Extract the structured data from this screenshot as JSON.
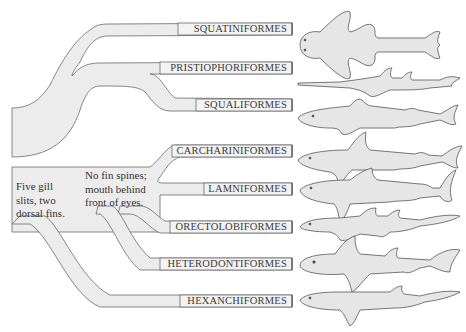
{
  "colors": {
    "band_fill": "#ececec",
    "band_stroke": "#6a6a6a",
    "text": "#333333",
    "shark_fill": "#e6e6e6",
    "shark_stroke": "#555555"
  },
  "root_trait": {
    "lines": [
      "Five gill",
      "slits, two",
      "dorsal fins."
    ]
  },
  "galeomorph_trait": {
    "lines": [
      "No fin spines;",
      "mouth behind",
      "front of eyes."
    ]
  },
  "orders": [
    {
      "name": "SQUATINIFORMES",
      "y": 23,
      "shark": "angel-shark"
    },
    {
      "name": "PRISTIOPHORIFORMES",
      "y": 62,
      "shark": "sawshark"
    },
    {
      "name": "SQUALIFORMES",
      "y": 99,
      "shark": "dogfish-shark"
    },
    {
      "name": "CARCHARINIFORMES",
      "y": 145,
      "shark": "ground-shark"
    },
    {
      "name": "LAMNIFORMES",
      "y": 183,
      "shark": "mackerel-shark"
    },
    {
      "name": "ORECTOLOBIFORMES",
      "y": 221,
      "shark": "carpet-shark"
    },
    {
      "name": "HETERODONTIFORMES",
      "y": 258,
      "shark": "bullhead-shark"
    },
    {
      "name": "HEXANCHIFORMES",
      "y": 295,
      "shark": "cow-shark"
    }
  ]
}
